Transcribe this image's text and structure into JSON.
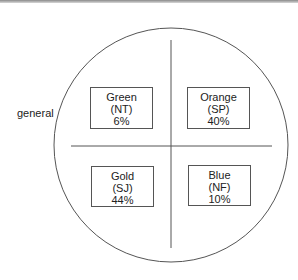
{
  "diagram": {
    "side_label": "general",
    "quadrants": [
      {
        "color": "Green",
        "code": "(NT)",
        "percent": "6%"
      },
      {
        "color": "Orange",
        "code": "(SP)",
        "percent": "40%"
      },
      {
        "color": "Gold",
        "code": "(SJ)",
        "percent": "44%"
      },
      {
        "color": "Blue",
        "code": "(NF)",
        "percent": "10%"
      }
    ]
  }
}
